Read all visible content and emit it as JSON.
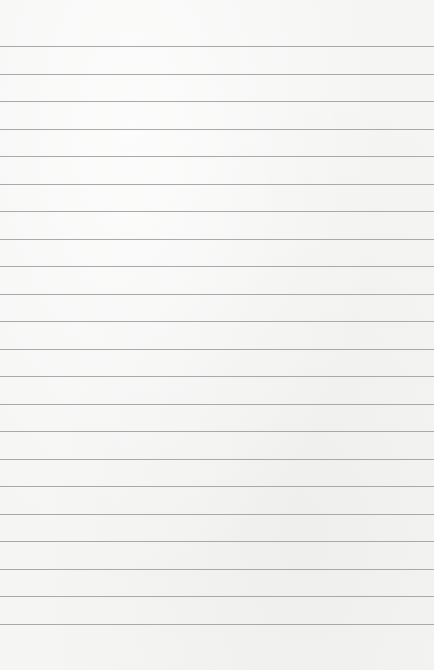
{
  "paper": {
    "type": "lined-paper",
    "background_color": "#f5f5f4",
    "line_color": "#a9a9a9",
    "line_count": 22,
    "first_line_y": 46,
    "line_spacing": 27.5
  }
}
